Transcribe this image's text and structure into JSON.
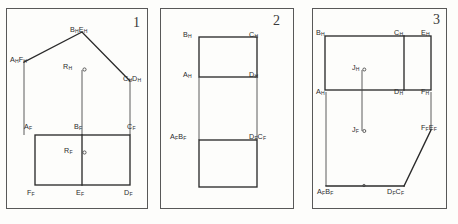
{
  "sheet": {
    "title": "Orthographic Projection Exercises",
    "background_color": "#fdfdfb",
    "line_color": "#2b2b2b",
    "projection_line_color": "#4a4a4a",
    "frame_color": "#585858"
  },
  "panels": [
    {
      "number": "1",
      "name": "panel-one",
      "description": "Gable-roof top view with front view rectangle below",
      "labels": [
        {
          "name": "label-ah-fh",
          "html": "A<sub>H</sub>F<sub>H</sub>",
          "x": 10,
          "y": 56
        },
        {
          "name": "label-bh-eh",
          "html": "B<sub>H</sub>E<sub>H</sub>",
          "x": 70,
          "y": 26
        },
        {
          "name": "label-ch-dh",
          "html": "C<sub>H</sub>D<sub>H</sub>",
          "x": 123,
          "y": 75
        },
        {
          "name": "label-rh",
          "html": "R<sub>H</sub>",
          "x": 63,
          "y": 68
        },
        {
          "name": "label-af",
          "html": "A<sub>F</sub>",
          "x": 24,
          "y": 123
        },
        {
          "name": "label-bf",
          "html": "B<sub>F</sub>",
          "x": 74,
          "y": 123
        },
        {
          "name": "label-cf",
          "html": "C<sub>F</sub>",
          "x": 127,
          "y": 123
        },
        {
          "name": "label-rf",
          "html": "R<sub>F</sub>",
          "x": 64,
          "y": 149
        },
        {
          "name": "label-ff",
          "html": "F<sub>F</sub>",
          "x": 27,
          "y": 189
        },
        {
          "name": "label-ef",
          "html": "E<sub>F</sub>",
          "x": 76,
          "y": 189
        },
        {
          "name": "label-df",
          "html": "D<sub>F</sub>",
          "x": 124,
          "y": 189
        }
      ]
    },
    {
      "number": "2",
      "name": "panel-two",
      "description": "Top view rectangle above, front view square below",
      "labels": [
        {
          "name": "label-bh",
          "html": "B<sub>H</sub>",
          "x": 28,
          "y": 31
        },
        {
          "name": "label-ch",
          "html": "C<sub>H</sub>",
          "x": 94,
          "y": 31
        },
        {
          "name": "label-ah",
          "html": "A<sub>H</sub>",
          "x": 28,
          "y": 73
        },
        {
          "name": "label-dh",
          "html": "D<sub>H</sub>",
          "x": 94,
          "y": 73
        },
        {
          "name": "label-af-bf",
          "html": "A<sub>F</sub>B<sub>F</sub>",
          "x": 16,
          "y": 135
        },
        {
          "name": "label-df-cf",
          "html": "D<sub>F</sub>C<sub>F</sub>",
          "x": 94,
          "y": 135
        }
      ]
    },
    {
      "number": "3",
      "name": "panel-three",
      "description": "Top view rectangle with partition, front view with inclined surface",
      "labels": [
        {
          "name": "label-bh",
          "html": "B<sub>H</sub>",
          "x": 8,
          "y": 29
        },
        {
          "name": "label-ch",
          "html": "C<sub>H</sub>",
          "x": 82,
          "y": 29
        },
        {
          "name": "label-eh",
          "html": "E<sub>H</sub>",
          "x": 112,
          "y": 29
        },
        {
          "name": "label-ah",
          "html": "A<sub>H</sub>",
          "x": 8,
          "y": 88
        },
        {
          "name": "label-jh",
          "html": "J<sub>H</sub>",
          "x": 44,
          "y": 72
        },
        {
          "name": "label-dh",
          "html": "D<sub>H</sub>",
          "x": 82,
          "y": 88
        },
        {
          "name": "label-fh",
          "html": "F<sub>H</sub>",
          "x": 112,
          "y": 88
        },
        {
          "name": "label-jf",
          "html": "J<sub>F</sub>",
          "x": 44,
          "y": 130
        },
        {
          "name": "label-ff-ef",
          "html": "F<sub>F</sub>E<sub>F</sub>",
          "x": 111,
          "y": 128
        },
        {
          "name": "label-af-bf",
          "html": "A<sub>F</sub>B<sub>F</sub>",
          "x": 9,
          "y": 190
        },
        {
          "name": "label-df-cf",
          "html": "D<sub>F</sub>C<sub>F</sub>",
          "x": 79,
          "y": 190
        }
      ]
    }
  ],
  "geometry": {
    "panel1": {
      "roof_apex": [
        82,
        32
      ],
      "roof_left": [
        24,
        62
      ],
      "roof_right": [
        130,
        81
      ],
      "rect": {
        "x": 35,
        "y": 135,
        "w": 95,
        "h": 50
      },
      "rect_divider_x": 82,
      "vertical_drops": [
        {
          "x": 24,
          "y1": 62,
          "y2": 135
        },
        {
          "x": 82,
          "y1": 70,
          "y2": 135
        },
        {
          "x": 130,
          "y1": 81,
          "y2": 135
        }
      ],
      "r_marker_top": [
        84,
        70
      ],
      "r_marker_bottom": [
        84,
        153
      ]
    },
    "panel2": {
      "top_rect": {
        "x": 44,
        "y": 37,
        "w": 58,
        "h": 40
      },
      "bottom_rect": {
        "x": 44,
        "y": 140,
        "w": 58,
        "h": 47
      },
      "vertical_drops": [
        {
          "x": 44,
          "y1": 77,
          "y2": 140
        },
        {
          "x": 102,
          "y1": 77,
          "y2": 140
        }
      ]
    },
    "panel3": {
      "top_rect": {
        "x": 17,
        "y": 36,
        "w": 106,
        "h": 54
      },
      "top_divider_x": 96,
      "j_line": {
        "x": 54,
        "y1": 72,
        "y2": 131
      },
      "front_left_drop": {
        "x": 18,
        "y1": 92,
        "y2": 186
      },
      "front_right_drop": {
        "x": 123,
        "y1": 92,
        "y2": 130
      },
      "front_bottom": {
        "x1": 18,
        "y1": 186,
        "x2": 96,
        "y2": 186
      },
      "front_incline": {
        "x1": 96,
        "y1": 186,
        "x2": 123,
        "y2": 130
      }
    }
  }
}
